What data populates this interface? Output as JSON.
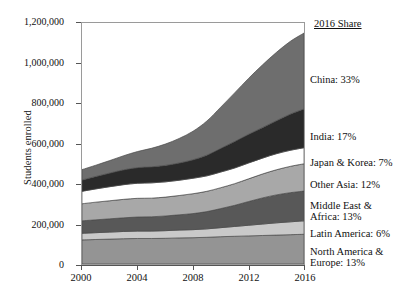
{
  "chart_data": {
    "type": "area",
    "title": "",
    "xlabel": "",
    "ylabel": "Students enrolled",
    "x": [
      2000,
      2001,
      2002,
      2003,
      2004,
      2005,
      2006,
      2007,
      2008,
      2009,
      2010,
      2011,
      2012,
      2013,
      2014,
      2015,
      2016
    ],
    "xlim": [
      2000,
      2016
    ],
    "ylim": [
      0,
      1200000
    ],
    "xticks": [
      2000,
      2004,
      2008,
      2012,
      2016
    ],
    "yticks": [
      0,
      200000,
      400000,
      600000,
      800000,
      1000000,
      1200000
    ],
    "ytick_labels": [
      "0",
      "200,000",
      "400,000",
      "600,000",
      "800,000",
      "1,000,000",
      "1,200,000"
    ],
    "xtick_labels": [
      "2000",
      "2004",
      "2008",
      "2012",
      "2016"
    ],
    "grid": false,
    "legend_position": "right",
    "stacking": "bottom-to-top",
    "series": [
      {
        "name": "North America & Europe",
        "legend_label": "North America &\nEurope: 13%",
        "share_2016": 13,
        "color": "#949494",
        "values": [
          120000,
          122000,
          124000,
          126000,
          127000,
          127000,
          128000,
          130000,
          131000,
          133000,
          136000,
          138000,
          140000,
          142000,
          144000,
          146000,
          148000
        ]
      },
      {
        "name": "Latin America",
        "legend_label": "Latin America: 6%",
        "share_2016": 6,
        "color": "#c9c9c9",
        "values": [
          33000,
          34000,
          35000,
          36000,
          37000,
          37000,
          38000,
          39000,
          40000,
          42000,
          45000,
          49000,
          53000,
          57000,
          61000,
          64000,
          67000
        ]
      },
      {
        "name": "Middle East & Africa",
        "legend_label": "Middle East &\nAfrica: 13%",
        "share_2016": 13,
        "color": "#585858",
        "values": [
          62000,
          64000,
          66000,
          68000,
          70000,
          71000,
          73000,
          76000,
          80000,
          86000,
          95000,
          105000,
          118000,
          130000,
          139000,
          145000,
          148000
        ]
      },
      {
        "name": "Other Asia",
        "legend_label": "Other Asia: 12%",
        "share_2016": 12,
        "color": "#a8a8a8",
        "values": [
          85000,
          88000,
          90000,
          92000,
          93000,
          93000,
          94000,
          96000,
          99000,
          101000,
          104000,
          108000,
          113000,
          119000,
          125000,
          131000,
          136000
        ]
      },
      {
        "name": "Japan & Korea",
        "legend_label": "Japan & Korea: 7%",
        "share_2016": 7,
        "color": "#ffffff",
        "values": [
          62000,
          66000,
          70000,
          73000,
          75000,
          76000,
          76000,
          76000,
          77000,
          77000,
          78000,
          78000,
          79000,
          79000,
          80000,
          80000,
          80000
        ]
      },
      {
        "name": "India",
        "legend_label": "India: 17%",
        "share_2016": 17,
        "color": "#2a2a2a",
        "values": [
          56000,
          62000,
          68000,
          74000,
          78000,
          80000,
          82000,
          86000,
          92000,
          103000,
          118000,
          132000,
          143000,
          152000,
          164000,
          180000,
          193000
        ]
      },
      {
        "name": "China",
        "legend_label": "China: 33%",
        "share_2016": 33,
        "color": "#6e6e6e",
        "values": [
          52000,
          56000,
          62000,
          70000,
          80000,
          92000,
          106000,
          122000,
          142000,
          170000,
          205000,
          242000,
          278000,
          312000,
          340000,
          362000,
          378000
        ]
      }
    ],
    "totals": [
      470000,
      492000,
      515000,
      539000,
      560000,
      576000,
      597000,
      625000,
      661000,
      712000,
      781000,
      852000,
      924000,
      991000,
      1053000,
      1108000,
      1150000
    ]
  },
  "legend": {
    "title": "2016 Share",
    "items": [
      {
        "label": "China: 33%",
        "y": 74
      },
      {
        "label": "India: 17%",
        "y": 131
      },
      {
        "label": "Japan & Korea: 7%",
        "y": 157
      },
      {
        "label": "Other Asia: 12%",
        "y": 179
      },
      {
        "label": "Middle East &",
        "y": 200
      },
      {
        "label": "Africa: 13%",
        "y": 211
      },
      {
        "label": "Latin America: 6%",
        "y": 228
      },
      {
        "label": "North America &",
        "y": 246
      },
      {
        "label": "Europe: 13%",
        "y": 257
      }
    ]
  },
  "axes": {
    "y_title": "Students enrolled"
  }
}
